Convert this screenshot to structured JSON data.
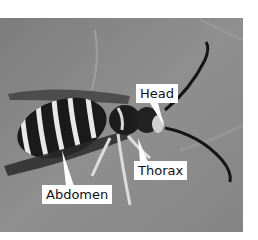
{
  "figure": {
    "style": "grayscale photograph",
    "labels": [
      {
        "id": "head",
        "text": "Head"
      },
      {
        "id": "thorax",
        "text": "Thorax"
      },
      {
        "id": "abdomen",
        "text": "Abdomen"
      }
    ]
  },
  "colors": {
    "background": "#ffffff",
    "photo_bg": "#8a8a8a",
    "label_bg": "#ffffff",
    "label_text": "#111111"
  }
}
